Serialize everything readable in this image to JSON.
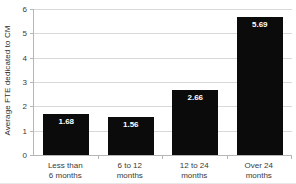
{
  "chart_data": {
    "type": "bar",
    "title": "",
    "subtitle": "",
    "xlabel": "",
    "ylabel": "Average FTE dedicated to CM",
    "categories": [
      "Less than 6 months",
      "6 to 12 months",
      "12 to 24 months",
      "Over 24 months"
    ],
    "category_lines": [
      [
        "Less than",
        "6 months"
      ],
      [
        "6 to 12",
        "months"
      ],
      [
        "12 to 24",
        "months"
      ],
      [
        "Over 24",
        "months"
      ]
    ],
    "values": [
      1.68,
      1.56,
      2.66,
      5.69
    ],
    "value_labels": [
      "1.68",
      "1.56",
      "2.66",
      "5.69"
    ],
    "ylim": [
      0,
      6
    ],
    "yticks": [
      0,
      1,
      2,
      3,
      4,
      5,
      6
    ],
    "ytick_labels": [
      "0",
      "1",
      "2",
      "3",
      "4",
      "5",
      "6"
    ],
    "grid": true,
    "legend": false,
    "legend_position": "none",
    "bar_color": "#0b0b0b",
    "value_label_color": "#ffffff",
    "gridline_color": "#d9d9d9",
    "axis_color": "#b6b6b6",
    "background_color": "#ffffff"
  }
}
